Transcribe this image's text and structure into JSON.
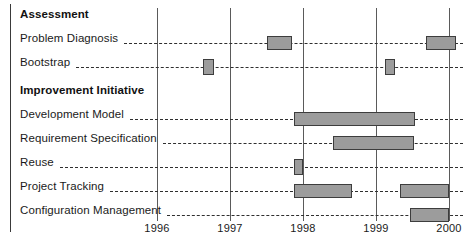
{
  "chart_data": {
    "type": "bar",
    "subtype": "gantt",
    "title": "",
    "xlabel": "",
    "ylabel": "",
    "xlim": [
      1995.0,
      2000.2
    ],
    "grid": true,
    "legend": "none",
    "tick_labels": [
      "1996",
      "1997",
      "1998",
      "1999",
      "2000"
    ],
    "tick_values": [
      1996,
      1997,
      1998,
      1999,
      2000
    ],
    "sections": [
      {
        "heading": "Assessment",
        "tasks": [
          {
            "label": "Problem Diagnosis",
            "bars": [
              {
                "start": 1997.5,
                "end": 1997.85
              },
              {
                "start": 1999.69,
                "end": 2000.1
              }
            ]
          },
          {
            "label": "Bootstrap",
            "bars": [
              {
                "start": 1996.63,
                "end": 1996.78
              },
              {
                "start": 1999.13,
                "end": 1999.26
              }
            ]
          }
        ]
      },
      {
        "heading": "Improvement Initiative",
        "tasks": [
          {
            "label": "Development Model",
            "bars": [
              {
                "start": 1997.88,
                "end": 1999.53
              }
            ]
          },
          {
            "label": "Requirement Specification",
            "bars": [
              {
                "start": 1998.41,
                "end": 1999.52
              }
            ]
          },
          {
            "label": "Reuse",
            "bars": [
              {
                "start": 1997.88,
                "end": 1998.0
              }
            ]
          },
          {
            "label": "Project Tracking",
            "bars": [
              {
                "start": 1997.88,
                "end": 1998.67
              },
              {
                "start": 1999.33,
                "end": 2000.0
              }
            ]
          },
          {
            "label": "Configuration Management",
            "bars": [
              {
                "start": 1999.47,
                "end": 2000.0
              }
            ]
          }
        ]
      }
    ],
    "colors": {
      "bar_fill": "#9c9c9c",
      "bar_border": "#3d3d3d",
      "gridline": "#5a5a5a",
      "leader_line": "#2f2f2f",
      "text": "#1a1a1a"
    }
  }
}
